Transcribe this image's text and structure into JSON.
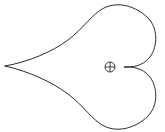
{
  "figure": {
    "title": "Cardioid outline with centroid marker",
    "caption": "",
    "background_color": "#ffffff",
    "canvas": {
      "width": 165,
      "height": 132
    },
    "shape": {
      "name": "cardioid-curve",
      "description": "Closed heart-shaped (cardioid) outline, cusp pointing left",
      "stroke_color": "#2b2b2b",
      "fill": "none",
      "stroke_width": 1,
      "cusp_point": {
        "x": 5,
        "y": 66
      },
      "notch_point": {
        "x": 124,
        "y": 67
      },
      "extents": {
        "left": 5,
        "right": 156,
        "top": 5,
        "bottom": 126
      },
      "path": "M 5 66 C 28 62 52 52 68 40 C 84 28 92 14 104 8 C 118 1 136 6 148 18 C 158 28 158 46 150 57 C 142 67 132 67 124 67 C 132 67 142 67 150 77 C 158 88 158 106 148 116 C 136 128 118 133 104 126 C 92 120 84 106 68 94 C 52 82 28 71 5 66 Z"
    },
    "marker": {
      "name": "centroid-marker",
      "glyph": "circled-plus",
      "symbol": "⊕",
      "color": "#2b2b2b",
      "center": {
        "x": 110,
        "y": 67
      },
      "radius": 5
    }
  }
}
